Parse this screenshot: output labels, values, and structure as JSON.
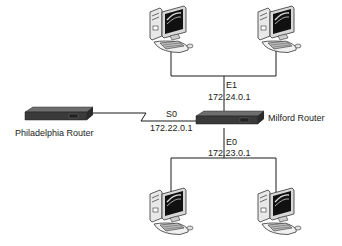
{
  "diagram": {
    "type": "network-topology",
    "routers": [
      {
        "id": "philadelphia",
        "label": "Philadelphia Router"
      },
      {
        "id": "milford",
        "label": "Milford Router"
      }
    ],
    "interfaces": {
      "s0": {
        "name": "S0",
        "ip": "172.22.0.1"
      },
      "e1": {
        "name": "E1",
        "ip": "172.24.0.1"
      },
      "e0": {
        "name": "E0",
        "ip": "172.23.0.1"
      }
    },
    "links": [
      {
        "from": "philadelphia",
        "to": "milford",
        "type": "serial",
        "interface": "S0"
      },
      {
        "from": "milford",
        "to": "lan-top",
        "type": "ethernet",
        "interface": "E1"
      },
      {
        "from": "milford",
        "to": "lan-bottom",
        "type": "ethernet",
        "interface": "E0"
      }
    ],
    "workstations": [
      {
        "id": "pc-top-left",
        "network": "lan-top"
      },
      {
        "id": "pc-top-right",
        "network": "lan-top"
      },
      {
        "id": "pc-bottom-left",
        "network": "lan-bottom"
      },
      {
        "id": "pc-bottom-right",
        "network": "lan-bottom"
      }
    ],
    "colors": {
      "line": "#1a1a1a",
      "router_top": "#5a5a5a",
      "router_side": "#2e2e2e",
      "pc_body": "#e6e6e6",
      "pc_screen": "#111111"
    }
  }
}
